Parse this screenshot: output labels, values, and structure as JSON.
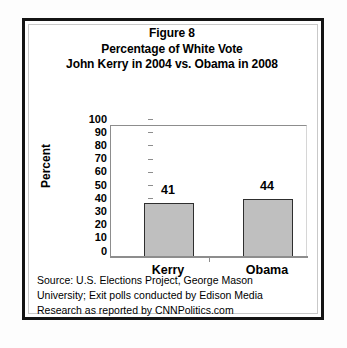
{
  "figure": {
    "title_lines": [
      "Figure 8",
      "Percentage of White Vote",
      "John Kerry in 2004 vs. Obama in 2008"
    ],
    "source_lines": [
      "Source: U.S. Elections Project, George Mason",
      "University; Exit polls conducted by Edison Media",
      "Research as reported by CNNPolitics.com"
    ]
  },
  "chart_data": {
    "type": "bar",
    "title": "Figure 8 Percentage of White Vote John Kerry in 2004 vs. Obama in 2008",
    "categories": [
      "Kerry",
      "Obama"
    ],
    "values": [
      41,
      44
    ],
    "data_labels": [
      "41",
      "44"
    ],
    "xlabel": "",
    "ylabel": "Percent",
    "ylim": [
      0,
      100
    ],
    "yticks": [
      100,
      90,
      80,
      70,
      60,
      50,
      40,
      30,
      20,
      10,
      0
    ],
    "ytick_labels": [
      "100",
      "90",
      "80",
      "70",
      "60",
      "50",
      "40",
      "30",
      "20",
      "10",
      "0"
    ],
    "grid": false,
    "legend": false,
    "bar_fill_color": "#bfbfbf",
    "bar_edge_color": "#2e2e2e",
    "axis_color": "#8d8d8d",
    "background_color": "#ffffff"
  }
}
